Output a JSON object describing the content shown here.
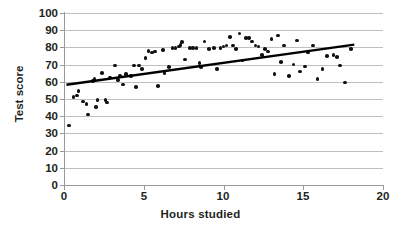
{
  "chart_data": {
    "type": "scatter",
    "title": "",
    "xlabel": "Hours studied",
    "ylabel": "Test score",
    "xlim": [
      0,
      20
    ],
    "ylim": [
      0,
      100
    ],
    "xticks": [
      0,
      5,
      10,
      15,
      20
    ],
    "yticks": [
      0,
      10,
      20,
      30,
      40,
      50,
      60,
      70,
      80,
      90,
      100
    ],
    "grid": "horizontal",
    "legend": "none",
    "marker_color": "#111111",
    "gridline_color": "#bfbfbf",
    "axis_color": "#9a9a9a",
    "background_color": "#ffffff",
    "series": [
      {
        "name": "Students",
        "marker": "filled-circle",
        "points": [
          [
            0.3,
            34.5
          ],
          [
            0.6,
            51.0
          ],
          [
            0.8,
            52.0
          ],
          [
            0.9,
            54.5
          ],
          [
            1.2,
            48.5
          ],
          [
            1.4,
            47.0
          ],
          [
            1.5,
            41.0
          ],
          [
            1.8,
            60.5
          ],
          [
            1.9,
            61.5
          ],
          [
            2.0,
            45.5
          ],
          [
            2.1,
            49.5
          ],
          [
            2.4,
            65.0
          ],
          [
            2.6,
            49.5
          ],
          [
            2.7,
            48.0
          ],
          [
            2.9,
            62.5
          ],
          [
            3.2,
            69.5
          ],
          [
            3.4,
            61.0
          ],
          [
            3.5,
            63.5
          ],
          [
            3.7,
            58.5
          ],
          [
            3.9,
            64.5
          ],
          [
            4.2,
            63.5
          ],
          [
            4.4,
            69.5
          ],
          [
            4.5,
            57.0
          ],
          [
            4.7,
            69.5
          ],
          [
            4.9,
            67.5
          ],
          [
            5.1,
            74.0
          ],
          [
            5.3,
            78.0
          ],
          [
            5.5,
            77.0
          ],
          [
            5.7,
            77.5
          ],
          [
            5.9,
            57.5
          ],
          [
            6.2,
            78.5
          ],
          [
            6.3,
            65.0
          ],
          [
            6.6,
            68.5
          ],
          [
            6.8,
            79.5
          ],
          [
            7.0,
            79.5
          ],
          [
            7.2,
            80.5
          ],
          [
            7.3,
            81.5
          ],
          [
            7.4,
            83.0
          ],
          [
            7.6,
            73.0
          ],
          [
            7.9,
            79.5
          ],
          [
            8.1,
            79.5
          ],
          [
            8.3,
            79.5
          ],
          [
            8.5,
            71.0
          ],
          [
            8.6,
            68.5
          ],
          [
            8.8,
            83.5
          ],
          [
            9.1,
            79.0
          ],
          [
            9.4,
            79.5
          ],
          [
            9.6,
            67.5
          ],
          [
            9.8,
            79.5
          ],
          [
            10.0,
            80.5
          ],
          [
            10.2,
            81.0
          ],
          [
            10.4,
            86.0
          ],
          [
            10.6,
            81.0
          ],
          [
            10.8,
            79.0
          ],
          [
            11.0,
            88.0
          ],
          [
            11.2,
            72.5
          ],
          [
            11.4,
            85.5
          ],
          [
            11.6,
            85.5
          ],
          [
            11.8,
            83.5
          ],
          [
            12.0,
            81.0
          ],
          [
            12.2,
            80.5
          ],
          [
            12.4,
            75.5
          ],
          [
            12.6,
            79.0
          ],
          [
            12.8,
            77.5
          ],
          [
            13.0,
            85.0
          ],
          [
            13.2,
            64.5
          ],
          [
            13.4,
            87.0
          ],
          [
            13.6,
            71.5
          ],
          [
            13.8,
            81.0
          ],
          [
            14.1,
            63.5
          ],
          [
            14.4,
            70.0
          ],
          [
            14.6,
            84.0
          ],
          [
            14.8,
            66.0
          ],
          [
            15.1,
            69.0
          ],
          [
            15.3,
            77.0
          ],
          [
            15.6,
            81.0
          ],
          [
            15.9,
            61.5
          ],
          [
            16.2,
            67.5
          ],
          [
            16.5,
            75.0
          ],
          [
            16.9,
            75.5
          ],
          [
            17.1,
            74.5
          ],
          [
            17.3,
            69.5
          ],
          [
            17.6,
            59.5
          ],
          [
            18.0,
            79.0
          ]
        ]
      }
    ],
    "trendline": {
      "name": "linear-fit",
      "color": "#000000",
      "x_start": 0.15,
      "y_start": 58.3,
      "x_end": 18.2,
      "y_end": 81.6
    }
  },
  "axis": {
    "y_tick_labels": [
      "100",
      "90",
      "80",
      "70",
      "60",
      "50",
      "40",
      "30",
      "20",
      "10",
      "0"
    ],
    "x_tick_labels": [
      "0",
      "5",
      "10",
      "15",
      "20"
    ],
    "x_title": "Hours studied",
    "y_title": "Test score"
  }
}
